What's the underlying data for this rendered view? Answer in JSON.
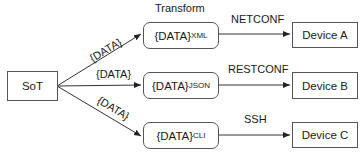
{
  "diagram": {
    "source": {
      "label": "SoT"
    },
    "transform_label": "Transform",
    "edge_label": "{DATA}",
    "transforms": [
      {
        "base": "{DATA}",
        "sub": "XML",
        "protocol": "NETCONF",
        "device": "Device A"
      },
      {
        "base": "{DATA}",
        "sub": "JSON",
        "protocol": "RESTCONF",
        "device": "Device B"
      },
      {
        "base": "{DATA}",
        "sub": "CLI",
        "protocol": "SSH",
        "device": "Device C"
      }
    ],
    "edge_labels": [
      "{DATA}",
      "{DATA}",
      "{DATA}"
    ]
  }
}
